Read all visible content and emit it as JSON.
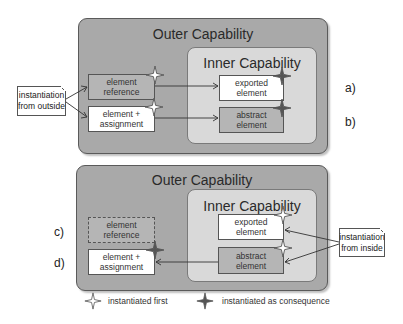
{
  "top_panel": {
    "outer_title": "Outer Capability",
    "inner_title": "Inner Capability",
    "left_elements": [
      {
        "line1": "element",
        "line2": "reference",
        "style": "gray",
        "marker": "instantiated-first"
      },
      {
        "line1": "element +",
        "line2": "assignment",
        "style": "white",
        "marker": "instantiated-first"
      }
    ],
    "inner_elements": [
      {
        "line1": "exported",
        "line2": "element",
        "style": "white",
        "marker": "instantiated-as-consequence"
      },
      {
        "line1": "abstract",
        "line2": "element",
        "style": "gray",
        "marker": "instantiated-as-consequence"
      }
    ],
    "note": {
      "line1": "instantiation",
      "line2": "from outside"
    },
    "row_labels": [
      "a)",
      "b)"
    ]
  },
  "bottom_panel": {
    "outer_title": "Outer Capability",
    "inner_title": "Inner Capability",
    "left_elements": [
      {
        "line1": "element",
        "line2": "reference",
        "style": "dashed",
        "marker": "none"
      },
      {
        "line1": "element +",
        "line2": "assignment",
        "style": "white",
        "marker": "instantiated-as-consequence"
      }
    ],
    "inner_elements": [
      {
        "line1": "exported",
        "line2": "element",
        "style": "white",
        "marker": "instantiated-first"
      },
      {
        "line1": "abstract",
        "line2": "element",
        "style": "gray",
        "marker": "instantiated-first"
      }
    ],
    "note": {
      "line1": "instantiation",
      "line2": "from inside"
    },
    "row_labels": [
      "c)",
      "d)"
    ]
  },
  "legend": {
    "items": [
      {
        "icon": "hollow-star-icon",
        "label": "instantiated first"
      },
      {
        "icon": "filled-star-icon",
        "label": "instantiated as consequence"
      }
    ]
  },
  "colors": {
    "outer_fill": "#a9a9a9",
    "inner_fill": "#d9d9d9",
    "gray_element": "#b5b5b5",
    "star_filled": "#555555",
    "star_hollow": "#ffffff"
  }
}
